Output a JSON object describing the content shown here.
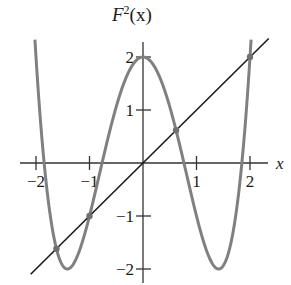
{
  "chart_data": {
    "type": "line",
    "title_base": "F",
    "title_sup": "2",
    "title_arg": "(x)",
    "xlabel": "x",
    "ylabel": "",
    "xlim": [
      -2.2,
      2.35
    ],
    "ylim": [
      -2.3,
      2.35
    ],
    "xticks": [
      -2,
      -1,
      1,
      2
    ],
    "xtick_labels": [
      "−2",
      "−1",
      "1",
      "2"
    ],
    "yticks": [
      2,
      1,
      -1,
      -2
    ],
    "ytick_labels": [
      "2",
      "1",
      "−1",
      "−2"
    ],
    "grid": false,
    "series": [
      {
        "name": "F^2(x) = (x^2 - 2)^2 - 2",
        "color": "#808080",
        "formula": "x^4 - 4x^2 + 2"
      },
      {
        "name": "y = x",
        "color": "#1a1a1a",
        "x": [
          -2.1,
          2.35
        ],
        "y": [
          -2.1,
          2.35
        ]
      }
    ],
    "fixed_points": [
      {
        "x": -1.618,
        "y": -1.618
      },
      {
        "x": -1,
        "y": -1
      },
      {
        "x": 0.618,
        "y": 0.618
      },
      {
        "x": 2,
        "y": 2
      }
    ]
  }
}
